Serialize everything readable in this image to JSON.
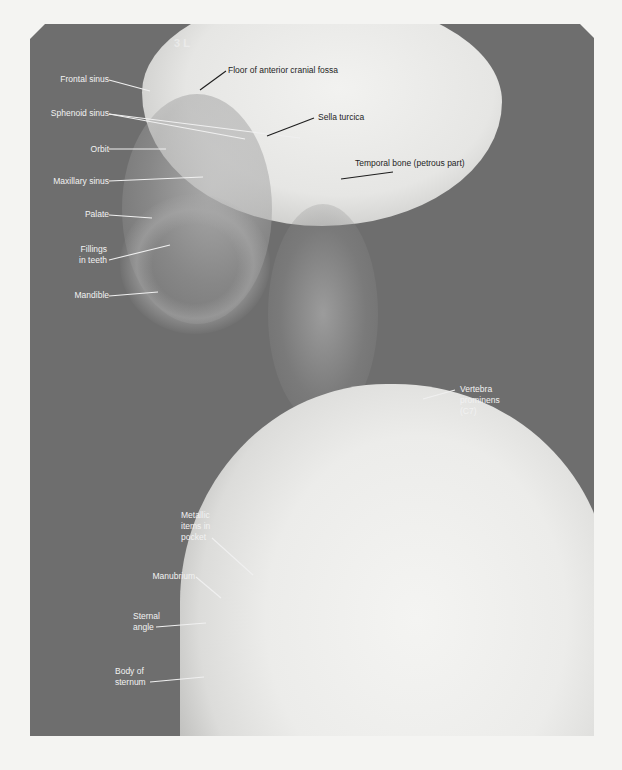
{
  "figure": {
    "type": "lateral radiograph of head, neck and upper thorax",
    "film_marking": "3 L",
    "colors": {
      "background": "#f4f4f2",
      "film_dark": "#6e6e6e",
      "bone_bright": "#f2f2f0",
      "label_light": "#f2f2f2",
      "label_dark": "#1e1e1e"
    }
  },
  "labels": {
    "frontal_sinus": "Frontal sinus",
    "floor_anterior_cranial_fossa": "Floor of anterior cranial fossa",
    "sphenoid_sinus": "Sphenoid sinus",
    "sella_turcica": "Sella turcica",
    "orbit": "Orbit",
    "temporal_bone": "Temporal bone (petrous part)",
    "maxillary_sinus": "Maxillary sinus",
    "palate": "Palate",
    "fillings_1": "Fillings",
    "fillings_2": "in teeth",
    "mandible": "Mandible",
    "vertebra_1": "Vertebra",
    "vertebra_2": "prominens",
    "vertebra_3": "(C7)",
    "metallic_1": "Metallic",
    "metallic_2": "items in",
    "metallic_3": "pocket",
    "manubrium": "Manubrium",
    "sternal_1": "Sternal",
    "sternal_2": "angle",
    "body_sternum_1": "Body of",
    "body_sternum_2": "sternum"
  }
}
